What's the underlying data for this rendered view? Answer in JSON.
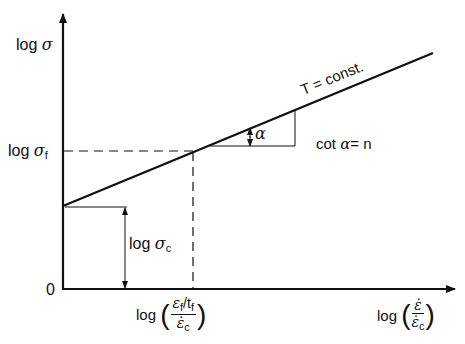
{
  "diagram": {
    "type": "log-log creep stress vs strain-rate schematic",
    "y_axis": {
      "label_prefix": "log",
      "label_symbol": "σ"
    },
    "x_axis": {
      "label_prefix": "log",
      "num": "ε̇",
      "den_symbol": "ε̇",
      "den_sub": "c"
    },
    "origin_label": "0",
    "line_label": "T = const.",
    "slope_label_prefix": "cot",
    "slope_symbol": "α",
    "slope_equals": "= n",
    "angle_label": "α",
    "sigma_f": {
      "prefix": "log",
      "symbol": "σ",
      "sub": "f"
    },
    "sigma_c": {
      "prefix": "log",
      "symbol": "σ",
      "sub": "c"
    },
    "x_mark": {
      "prefix": "log",
      "num_symbol": "ε",
      "num_sub1": "f",
      "num_mid": "/t",
      "num_sub2": "f",
      "den_symbol": "ε̇",
      "den_sub": "c"
    },
    "colors": {
      "line": "#111111",
      "background": "#ffffff"
    }
  }
}
